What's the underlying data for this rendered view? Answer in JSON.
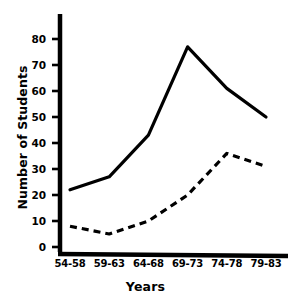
{
  "chart_data": {
    "type": "line",
    "title": "",
    "xlabel": "Years",
    "ylabel": "Number of Students",
    "categories": [
      "54-58",
      "59-63",
      "64-68",
      "69-73",
      "74-78",
      "79-83"
    ],
    "yticks": [
      0,
      10,
      20,
      30,
      40,
      50,
      60,
      70,
      80
    ],
    "ylim": [
      0,
      87
    ],
    "grid": false,
    "legend": "none",
    "series": [
      {
        "name": "solid-series",
        "style": "solid",
        "color": "#000000",
        "values": [
          22,
          27,
          43,
          77,
          61,
          50
        ]
      },
      {
        "name": "dashed-series",
        "style": "dashed",
        "color": "#000000",
        "values": [
          8,
          5,
          10,
          20,
          36,
          31
        ]
      }
    ],
    "annotations": []
  },
  "axes": {
    "y_title": "Number of Students",
    "x_title": "Years",
    "y_tick_labels": [
      "80",
      "70",
      "60",
      "50",
      "40",
      "30",
      "20",
      "10",
      "0"
    ],
    "x_tick_labels": [
      "54-58",
      "59-63",
      "64-68",
      "69-73",
      "74-78",
      "79-83"
    ]
  },
  "colors": {
    "ink": "#000000",
    "background": "#ffffff"
  }
}
